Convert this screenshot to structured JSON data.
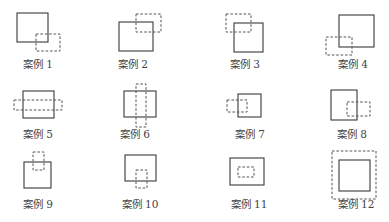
{
  "cases": [
    {
      "label": "案例 1",
      "solid": [
        17,
        13,
        31,
        29
      ],
      "dashed": [
        36,
        34,
        24,
        17
      ],
      "label_pos": [
        38,
        63
      ]
    },
    {
      "label": "案例 2",
      "solid": [
        119,
        22,
        34,
        29
      ],
      "dashed": [
        136,
        14,
        25,
        18
      ],
      "label_pos": [
        133,
        63
      ]
    },
    {
      "label": "案例 3",
      "solid": [
        234,
        23,
        29,
        29
      ],
      "dashed": [
        226,
        14,
        25,
        18
      ],
      "label_pos": [
        245,
        63
      ]
    },
    {
      "label": "案例 4",
      "solid": [
        339,
        15,
        35,
        32
      ],
      "dashed": [
        326,
        37,
        26,
        18
      ],
      "label_pos": [
        353,
        63
      ]
    },
    {
      "label": "案例 5",
      "solid": [
        23,
        91,
        31,
        27
      ],
      "dashed": [
        14,
        100,
        48,
        10
      ],
      "label_pos": [
        38,
        133
      ]
    },
    {
      "label": "案例 6",
      "solid": [
        124,
        91,
        32,
        26
      ],
      "dashed": [
        136,
        84,
        10,
        43
      ],
      "label_pos": [
        135,
        133
      ]
    },
    {
      "label": "案例 7",
      "solid": [
        238,
        94,
        23,
        23
      ],
      "dashed": [
        227,
        100,
        20,
        12
      ],
      "label_pos": [
        250,
        133
      ]
    },
    {
      "label": "案例 8",
      "solid": [
        331,
        90,
        26,
        30
      ],
      "dashed": [
        347,
        102,
        23,
        14
      ],
      "label_pos": [
        352,
        133
      ]
    },
    {
      "label": "案例 9",
      "solid": [
        24,
        162,
        27,
        26
      ],
      "dashed": [
        33,
        152,
        11,
        18
      ],
      "label_pos": [
        38,
        203
      ]
    },
    {
      "label": "案例 10",
      "solid": [
        125,
        155,
        31,
        26
      ],
      "dashed": [
        136,
        170,
        11,
        18
      ],
      "label_pos": [
        140,
        203
      ]
    },
    {
      "label": "案例 11",
      "solid": [
        230,
        158,
        34,
        27
      ],
      "dashed": [
        238,
        167,
        16,
        10
      ],
      "label_pos": [
        249,
        203
      ]
    },
    {
      "label": "案例 12",
      "solid": [
        339,
        160,
        31,
        31
      ],
      "dashed": [
        332,
        151,
        44,
        48
      ],
      "label_pos": [
        356,
        203
      ]
    }
  ]
}
